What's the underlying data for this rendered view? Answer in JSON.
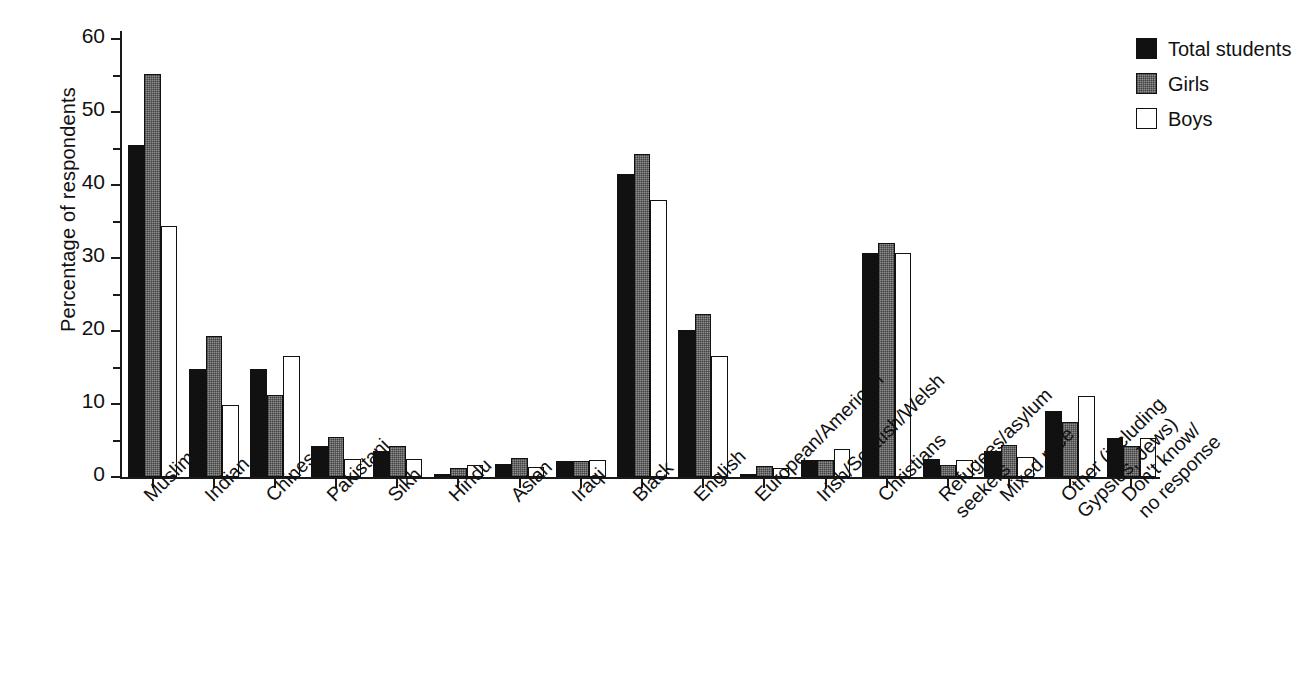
{
  "chart_data": {
    "type": "bar",
    "title": "",
    "xlabel": "",
    "ylabel": "Percentage of respondents",
    "ylim": [
      0,
      60
    ],
    "yticks": [
      0,
      10,
      20,
      30,
      40,
      50,
      60
    ],
    "ytick_labels": [
      "0",
      "10",
      "20",
      "30",
      "40",
      "50",
      "60"
    ],
    "minor_tick_step": 5,
    "grid": false,
    "legend_position": "top-right",
    "categories": [
      "Muslim",
      "Indian",
      "Chinese",
      "Pakistani",
      "Sikh",
      "Hindu",
      "Asian",
      "Iraqi",
      "Black",
      "English",
      "European/American",
      "Irish/Scottish/Welsh",
      "Christians",
      "Refugees/asylum\nseekers",
      "Mixed race",
      "Other (including\nGypsies, Jews)",
      "Don't know/\nno response"
    ],
    "series": [
      {
        "name": "Total students",
        "color": "#111111",
        "values": [
          45.5,
          14.8,
          14.8,
          4.2,
          3.6,
          0.4,
          -1.8,
          -2.2,
          41.5,
          20.2,
          0.4,
          -2.3,
          30.7,
          -2.5,
          -3.5,
          9.0,
          5.4
        ]
      },
      {
        "name": "Girls",
        "color": "#8f8f8f",
        "values": [
          55.2,
          19.3,
          11.2,
          5.5,
          4.2,
          -1.3,
          -2.6,
          -2.2,
          44.2,
          22.3,
          -1.5,
          -2.3,
          32.0,
          -1.7,
          -4.4,
          7.6,
          4.2
        ]
      },
      {
        "name": "Boys",
        "color": "#ffffff",
        "values": [
          34.4,
          9.9,
          16.6,
          2.5,
          2.4,
          1.6,
          1.4,
          -2.3,
          38.0,
          16.6,
          1.3,
          -3.8,
          30.7,
          -2.3,
          -2.8,
          11.1,
          5.4
        ]
      }
    ]
  },
  "legend": {
    "items": [
      {
        "label": "Total students",
        "swatch": "total"
      },
      {
        "label": "Girls",
        "swatch": "girls"
      },
      {
        "label": "Boys",
        "swatch": "boys"
      }
    ]
  },
  "axis": {
    "y_title": "Percentage of respondents"
  }
}
